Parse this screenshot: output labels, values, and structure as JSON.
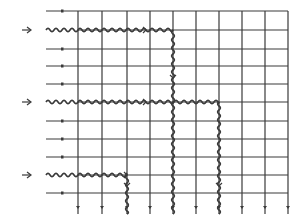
{
  "diagram": {
    "type": "grid-signal-propagation",
    "colors": {
      "line": "#3a3a3a",
      "background": "#ffffff"
    },
    "grid": {
      "left_x": 46,
      "right_x": 288,
      "top_y": 11,
      "bottom_y": 214,
      "row_y": [
        11,
        30,
        49,
        66,
        84,
        102,
        121,
        139,
        157,
        175,
        193
      ],
      "col_x": [
        78,
        102,
        127,
        150,
        173,
        196,
        219,
        242,
        265,
        288
      ],
      "row_tick_x": 62
    },
    "inputs": [
      {
        "label": "input-arrow-1",
        "row_index": 1,
        "glyph": "→"
      },
      {
        "label": "input-arrow-2",
        "row_index": 5,
        "glyph": "→"
      },
      {
        "label": "input-arrow-3",
        "row_index": 9,
        "glyph": "→"
      }
    ],
    "wavy_paths": [
      {
        "name": "path-1",
        "horizontal": {
          "row_y": 30,
          "x_from": 46,
          "x_to": 173
        },
        "vertical": {
          "col_x": 173,
          "y_from": 30,
          "y_to": 102
        }
      },
      {
        "name": "path-2",
        "horizontal": {
          "row_y": 102,
          "x_from": 46,
          "x_to": 219
        },
        "vertical": [
          {
            "col_x": 173,
            "y_from": 102,
            "y_to": 214
          },
          {
            "col_x": 219,
            "y_from": 102,
            "y_to": 214
          }
        ]
      },
      {
        "name": "path-3",
        "horizontal": {
          "row_y": 175,
          "x_from": 46,
          "x_to": 127
        },
        "vertical": {
          "col_x": 127,
          "y_from": 175,
          "y_to": 214
        }
      }
    ]
  }
}
